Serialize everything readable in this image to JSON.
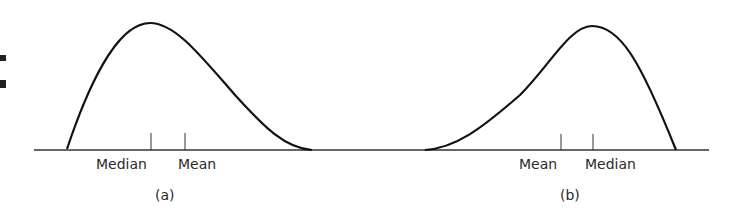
{
  "figure": {
    "panels": [
      {
        "id": "a",
        "caption": "(a)",
        "skew": "right",
        "ticks": [
          {
            "label": "Median",
            "x": 150
          },
          {
            "label": "Mean",
            "x": 185
          }
        ]
      },
      {
        "id": "b",
        "caption": "(b)",
        "skew": "left",
        "ticks": [
          {
            "label": "Mean",
            "x": 561
          },
          {
            "label": "Median",
            "x": 593
          }
        ]
      }
    ],
    "line_color": "#111111"
  }
}
